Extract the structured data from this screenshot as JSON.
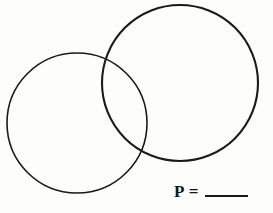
{
  "figure": {
    "type": "venn-diagram",
    "background_color": "#fdfdfc",
    "stroke_color": "#1a1a1a",
    "circles": [
      {
        "name": "left-circle",
        "cx": 77,
        "cy": 123,
        "r": 70,
        "stroke_width": 1.6
      },
      {
        "name": "right-circle",
        "cx": 180,
        "cy": 83,
        "r": 78,
        "stroke_width": 2.1
      }
    ],
    "intersection_points": [
      {
        "x": 112,
        "y": 58
      },
      {
        "x": 143,
        "y": 150
      }
    ]
  },
  "answer": {
    "label": "P",
    "equals": "=",
    "value": "",
    "blank_width_px": 43
  }
}
